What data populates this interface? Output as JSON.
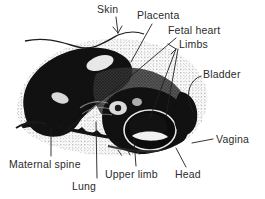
{
  "figure": {
    "kind": "labeled-anatomical-illustration",
    "background_color": "#ffffff",
    "ink_color": "#111111",
    "label_text_color": "#2b2b2b",
    "width": 265,
    "height": 199
  },
  "labels": [
    {
      "id": "skin",
      "text": "Skin",
      "x": 97,
      "y": 4,
      "leader": "arrow pointing down-left to the skin surface line",
      "target_x": 118,
      "target_y": 35
    },
    {
      "id": "placenta",
      "text": "Placenta",
      "x": 137,
      "y": 10,
      "leader": "line running down-left into the placental mass",
      "target_x": 124,
      "target_y": 62
    },
    {
      "id": "fetal-heart",
      "text": "Fetal heart",
      "x": 168,
      "y": 25,
      "leader": "long diagonal line down-left to the fetal heart region",
      "target_x": 60,
      "target_y": 135
    },
    {
      "id": "limbs",
      "text": "Limbs",
      "x": 176,
      "y": 39,
      "leader": "two lines fanning down to the fetal limbs",
      "target_x": 158,
      "target_y": 118
    },
    {
      "id": "bladder",
      "text": "Bladder",
      "x": 203,
      "y": 69,
      "leader": "curved hook line to the bladder",
      "target_x": 196,
      "target_y": 112
    },
    {
      "id": "vagina",
      "text": "Vagina",
      "x": 216,
      "y": 135,
      "leader": "short line to the left toward the vaginal canal",
      "target_x": 196,
      "target_y": 140
    },
    {
      "id": "head",
      "text": "Head",
      "x": 175,
      "y": 170,
      "leader": "line running up-left to the fetal head",
      "target_x": 164,
      "target_y": 146
    },
    {
      "id": "upper-limb",
      "text": "Upper limb",
      "x": 108,
      "y": 170,
      "leader": "vertical line up to the upper limb",
      "target_x": 133,
      "target_y": 142
    },
    {
      "id": "lung",
      "text": "Lung",
      "x": 72,
      "y": 182,
      "leader": "long vertical line up to the lung field",
      "target_x": 96,
      "target_y": 120
    },
    {
      "id": "maternal-spine",
      "text": "Maternal spine",
      "x": 9,
      "y": 160,
      "leader": "vertical line up to the maternal spine",
      "target_x": 51,
      "target_y": 127
    }
  ]
}
